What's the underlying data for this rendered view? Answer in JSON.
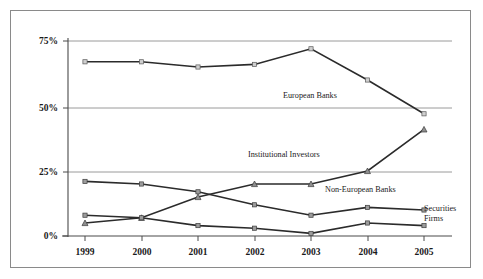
{
  "chart_data": {
    "type": "line",
    "title": "",
    "subtitle": "",
    "xlabel": "",
    "ylabel": "",
    "categories": [
      "1999",
      "2000",
      "2001",
      "2002",
      "2003",
      "2004",
      "2005"
    ],
    "ylim": [
      0,
      75
    ],
    "yticks": [
      0,
      25,
      50,
      75
    ],
    "ytick_labels": [
      "0%",
      "25%",
      "50%",
      "75%"
    ],
    "grid": true,
    "legend_position": "inline-annotations",
    "series": [
      {
        "name": "European Banks",
        "marker": "square",
        "values": [
          67,
          67,
          65,
          66,
          72,
          60,
          47
        ]
      },
      {
        "name": "Institutional Investors",
        "marker": "triangle",
        "values": [
          5,
          7,
          15,
          20,
          20,
          25,
          41
        ]
      },
      {
        "name": "Non-European Banks",
        "marker": "square",
        "values": [
          21,
          20,
          17,
          12,
          8,
          11,
          10
        ]
      },
      {
        "name": "Securities Firms",
        "marker": "square",
        "values": [
          8,
          7,
          4,
          3,
          1,
          5,
          4
        ]
      }
    ],
    "annotations": [
      {
        "text": "European Banks",
        "x": 283,
        "y": 98
      },
      {
        "text": "Institutional Investors",
        "x": 248,
        "y": 157
      },
      {
        "text": "Non-European Banks",
        "x": 325,
        "y": 192
      },
      {
        "text": "Securities",
        "x": 416,
        "y": 209
      },
      {
        "text": "Firms",
        "x": 416,
        "y": 220
      }
    ],
    "colors": {
      "line": "#2b2b2b",
      "gridline": "#9a9a9a",
      "axis": "#4a4a4a",
      "background": "#ffffff",
      "border": "#8a8a8a",
      "text": "#1a1a1a"
    }
  },
  "axes": {
    "y_ticks": [
      "75%",
      "50%",
      "25%",
      "0%"
    ],
    "x_ticks": [
      "1999",
      "2000",
      "2001",
      "2002",
      "2003",
      "2004",
      "2005"
    ]
  },
  "labels": {
    "european_banks": "European Banks",
    "institutional_investors": "Institutional Investors",
    "non_european_banks": "Non-European Banks",
    "securities_line1": "Securities",
    "securities_line2": "Firms"
  }
}
